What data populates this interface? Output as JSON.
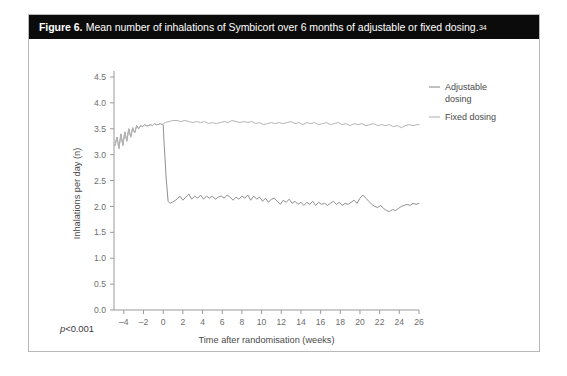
{
  "figure": {
    "label": "Figure 6.",
    "caption": "Mean number of inhalations of Symbicort over 6 months of adjustable or fixed dosing.",
    "reference_superscript": "34",
    "footnote": "p<0.001",
    "footnote_italic_prefix": "p",
    "footnote_rest": "<0.001",
    "border_color": "#b9b9b9",
    "title_bar_color": "#0b0b0b",
    "title_text_color": "#ffffff"
  },
  "chart_data": {
    "type": "line",
    "title": "Mean number of inhalations of Symbicort over 6 months of adjustable or fixed dosing.",
    "xlabel": "Time after randomisation (weeks)",
    "ylabel": "Inhalations per day (n)",
    "xlim": [
      -5,
      26
    ],
    "ylim": [
      0.0,
      4.5
    ],
    "xticks": [
      -4,
      -2,
      0,
      2,
      4,
      6,
      8,
      10,
      12,
      14,
      16,
      18,
      20,
      22,
      24,
      26
    ],
    "xtick_labels": [
      "–4",
      "–2",
      "0",
      "2",
      "4",
      "6",
      "8",
      "10",
      "12",
      "14",
      "16",
      "18",
      "20",
      "22",
      "24",
      "26"
    ],
    "yticks": [
      0.0,
      0.5,
      1.0,
      1.5,
      2.0,
      2.5,
      3.0,
      3.5,
      4.0,
      4.5
    ],
    "ytick_labels": [
      "0.0",
      "0.5",
      "1.0",
      "1.5",
      "2.0",
      "2.5",
      "3.0",
      "3.5",
      "4.0",
      "4.5"
    ],
    "grid": false,
    "legend_position": "top-right-outside",
    "annotations": [
      "p<0.001"
    ],
    "series": [
      {
        "name": "Adjustable dosing",
        "color": "#8f8f8f",
        "line_width": 1.0,
        "x": [
          -4.9,
          -4.7,
          -4.5,
          -4.3,
          -4.1,
          -3.9,
          -3.7,
          -3.5,
          -3.3,
          -3.1,
          -2.9,
          -2.7,
          -2.5,
          -2.3,
          -2.1,
          -1.9,
          -1.7,
          -1.5,
          -1.3,
          -1.1,
          -0.9,
          -0.7,
          -0.5,
          -0.3,
          -0.1,
          0.0,
          0.1,
          0.3,
          0.5,
          0.7,
          0.9,
          1.1,
          1.4,
          1.7,
          2.0,
          2.3,
          2.6,
          2.9,
          3.2,
          3.5,
          3.8,
          4.1,
          4.4,
          4.7,
          5.0,
          5.3,
          5.6,
          5.9,
          6.2,
          6.5,
          6.8,
          7.1,
          7.4,
          7.7,
          8.0,
          8.3,
          8.6,
          8.9,
          9.2,
          9.5,
          9.8,
          10.1,
          10.4,
          10.7,
          11.0,
          11.3,
          11.6,
          11.9,
          12.2,
          12.5,
          12.8,
          13.1,
          13.4,
          13.7,
          14.0,
          14.3,
          14.6,
          14.9,
          15.2,
          15.5,
          15.8,
          16.1,
          16.4,
          16.7,
          17.0,
          17.3,
          17.6,
          17.9,
          18.2,
          18.5,
          18.8,
          19.1,
          19.4,
          19.7,
          20.0,
          20.3,
          20.6,
          20.9,
          21.2,
          21.5,
          21.8,
          22.1,
          22.4,
          22.7,
          23.0,
          23.3,
          23.6,
          23.9,
          24.2,
          24.5,
          24.8,
          25.1,
          25.4,
          25.7,
          26.0
        ],
        "y": [
          3.18,
          3.34,
          3.12,
          3.4,
          3.18,
          3.44,
          3.26,
          3.5,
          3.34,
          3.52,
          3.42,
          3.56,
          3.5,
          3.56,
          3.54,
          3.58,
          3.56,
          3.56,
          3.58,
          3.56,
          3.6,
          3.58,
          3.58,
          3.6,
          3.58,
          3.58,
          3.2,
          2.55,
          2.1,
          2.06,
          2.08,
          2.1,
          2.14,
          2.2,
          2.12,
          2.18,
          2.24,
          2.14,
          2.2,
          2.16,
          2.22,
          2.14,
          2.2,
          2.16,
          2.2,
          2.14,
          2.18,
          2.2,
          2.16,
          2.22,
          2.18,
          2.12,
          2.18,
          2.14,
          2.2,
          2.16,
          2.22,
          2.12,
          2.2,
          2.14,
          2.18,
          2.1,
          2.16,
          2.08,
          2.14,
          2.16,
          2.1,
          2.04,
          2.12,
          2.08,
          2.14,
          2.06,
          2.1,
          2.04,
          2.08,
          2.02,
          2.08,
          2.04,
          2.1,
          2.02,
          2.08,
          2.04,
          2.06,
          2.02,
          2.06,
          2.1,
          2.04,
          2.08,
          2.02,
          2.06,
          2.04,
          2.08,
          2.12,
          2.06,
          2.16,
          2.22,
          2.16,
          2.1,
          2.04,
          2.0,
          1.98,
          2.02,
          1.96,
          1.92,
          1.9,
          1.94,
          1.92,
          1.96,
          2.0,
          2.02,
          2.04,
          2.02,
          2.06,
          2.04,
          2.06
        ]
      },
      {
        "name": "Fixed dosing",
        "color": "#b5b5b5",
        "line_width": 1.0,
        "x": [
          -4.9,
          -4.7,
          -4.5,
          -4.3,
          -4.1,
          -3.9,
          -3.7,
          -3.5,
          -3.3,
          -3.1,
          -2.9,
          -2.7,
          -2.5,
          -2.3,
          -2.1,
          -1.9,
          -1.7,
          -1.5,
          -1.3,
          -1.1,
          -0.9,
          -0.7,
          -0.5,
          -0.3,
          -0.1,
          0.2,
          0.6,
          1.0,
          1.4,
          1.8,
          2.2,
          2.6,
          3.0,
          3.4,
          3.8,
          4.2,
          4.6,
          5.0,
          5.4,
          5.8,
          6.2,
          6.6,
          7.0,
          7.4,
          7.8,
          8.2,
          8.6,
          9.0,
          9.4,
          9.8,
          10.2,
          10.6,
          11.0,
          11.4,
          11.8,
          12.2,
          12.6,
          13.0,
          13.4,
          13.8,
          14.2,
          14.6,
          15.0,
          15.4,
          15.8,
          16.2,
          16.6,
          17.0,
          17.4,
          17.8,
          18.2,
          18.6,
          19.0,
          19.4,
          19.8,
          20.2,
          20.6,
          21.0,
          21.4,
          21.8,
          22.2,
          22.6,
          23.0,
          23.4,
          23.8,
          24.2,
          24.6,
          25.0,
          25.4,
          25.8,
          26.0
        ],
        "y": [
          3.18,
          3.34,
          3.12,
          3.4,
          3.18,
          3.44,
          3.26,
          3.5,
          3.34,
          3.52,
          3.42,
          3.56,
          3.5,
          3.56,
          3.54,
          3.58,
          3.56,
          3.56,
          3.58,
          3.56,
          3.6,
          3.58,
          3.58,
          3.6,
          3.58,
          3.62,
          3.64,
          3.66,
          3.66,
          3.64,
          3.66,
          3.64,
          3.62,
          3.64,
          3.62,
          3.64,
          3.6,
          3.62,
          3.6,
          3.62,
          3.64,
          3.62,
          3.66,
          3.64,
          3.62,
          3.64,
          3.62,
          3.64,
          3.6,
          3.62,
          3.58,
          3.6,
          3.62,
          3.6,
          3.62,
          3.6,
          3.62,
          3.64,
          3.6,
          3.62,
          3.58,
          3.62,
          3.6,
          3.62,
          3.58,
          3.6,
          3.62,
          3.58,
          3.6,
          3.62,
          3.58,
          3.6,
          3.56,
          3.6,
          3.58,
          3.6,
          3.56,
          3.58,
          3.6,
          3.56,
          3.58,
          3.56,
          3.58,
          3.54,
          3.56,
          3.52,
          3.56,
          3.58,
          3.56,
          3.58,
          3.58
        ]
      }
    ],
    "legend": [
      {
        "label_line1": "Adjustable",
        "label_line2": "dosing",
        "color": "#8f8f8f"
      },
      {
        "label_line1": "Fixed dosing",
        "label_line2": "",
        "color": "#b5b5b5"
      }
    ]
  }
}
